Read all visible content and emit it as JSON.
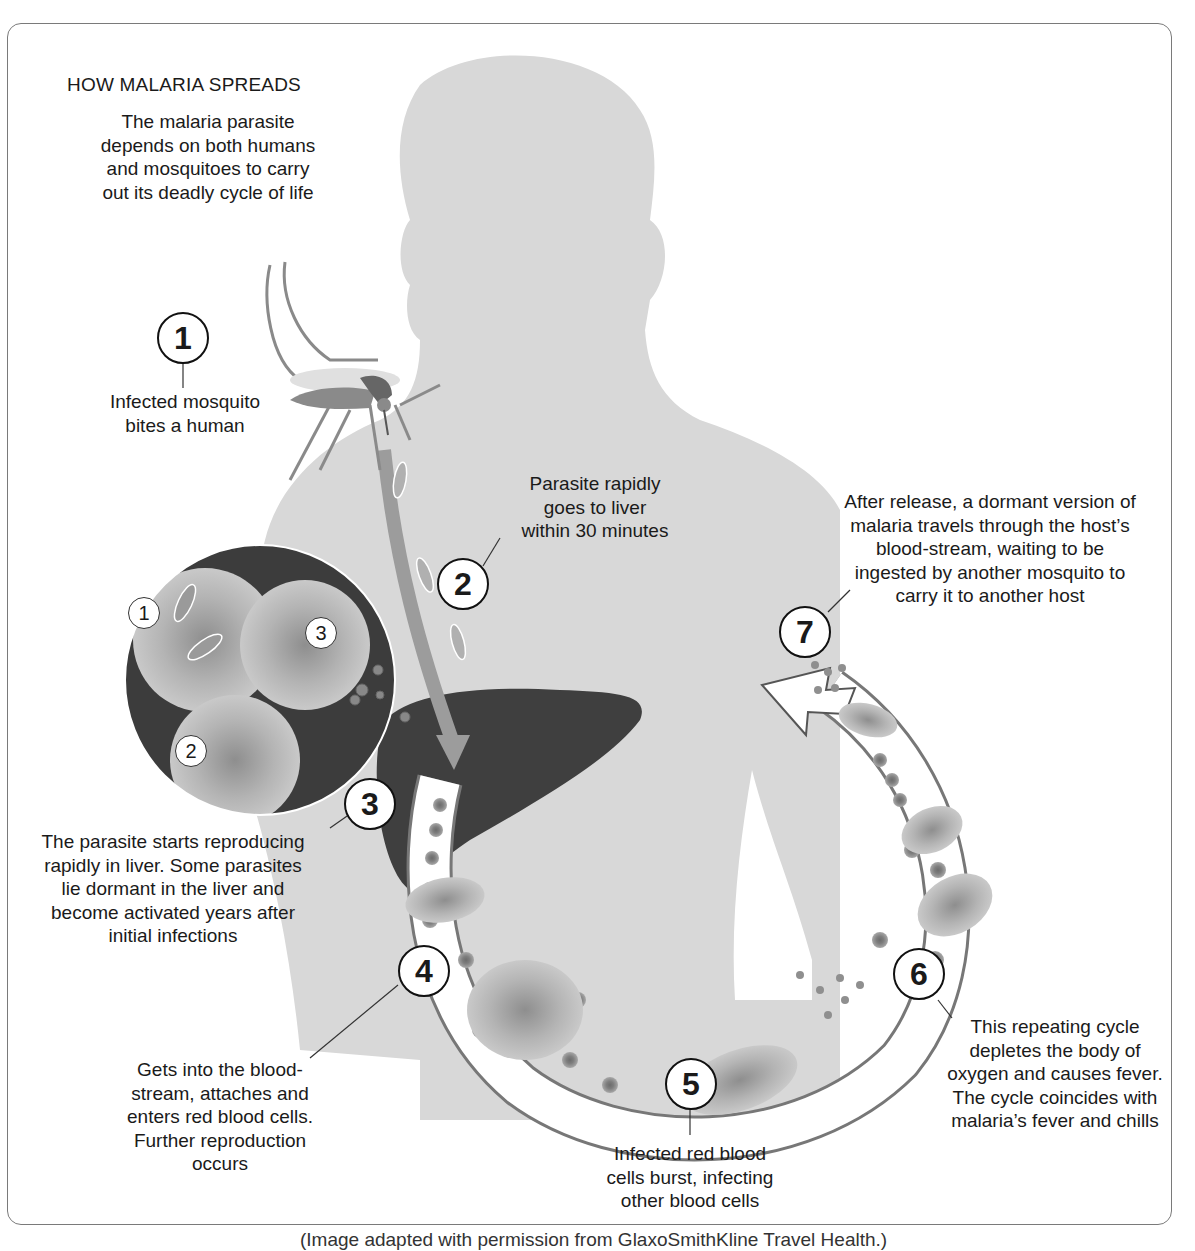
{
  "title": "HOW MALARIA SPREADS",
  "subtitle": [
    "The malaria parasite",
    "depends on both humans",
    "and mosquitoes to carry",
    "out its deadly cycle of life"
  ],
  "steps": [
    {
      "number": "1",
      "text": [
        "Infected mosquito",
        "bites a human"
      ]
    },
    {
      "number": "2",
      "text": [
        "Parasite rapidly",
        "goes to liver",
        "within 30 minutes"
      ]
    },
    {
      "number": "3",
      "text": [
        "The parasite starts reproducing",
        "rapidly in liver.  Some parasites",
        "lie dormant in the liver and",
        "become activated years after",
        "initial infections"
      ]
    },
    {
      "number": "4",
      "text": [
        "Gets into the blood-",
        "stream, attaches and",
        "enters red blood cells.",
        "Further reproduction",
        "occurs"
      ]
    },
    {
      "number": "5",
      "text": [
        "Infected red blood",
        "cells burst, infecting",
        "other blood cells"
      ]
    },
    {
      "number": "6",
      "text": [
        "This repeating cycle",
        "depletes the body of",
        "oxygen and causes fever.",
        "The cycle coincides with",
        "malaria’s fever and chills"
      ]
    },
    {
      "number": "7",
      "text": [
        "After release, a dormant version of",
        "malaria travels through the host’s",
        "blood-stream, waiting to be",
        "ingested by another mosquito to",
        "carry it to another host"
      ]
    }
  ],
  "inset": {
    "labels": [
      "1",
      "2",
      "3"
    ]
  },
  "caption": "(Image adapted with permission from GlaxoSmithKline Travel Health.)",
  "colors": {
    "silhouette": "#d6d6d6",
    "liver": "#3e3e3e",
    "frame": "#7a7a7a",
    "cell": "#9a9a9a"
  }
}
